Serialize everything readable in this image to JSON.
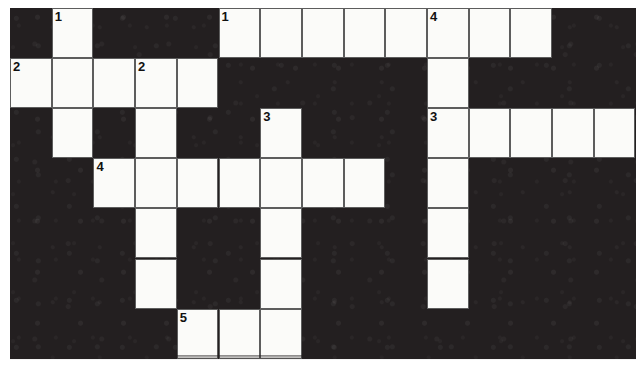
{
  "puzzle": {
    "title": "Crossword Grid",
    "grid": {
      "columns": 15,
      "rows": 7,
      "cell_width": 41.7,
      "cell_height": 50.1,
      "block_color": "#231f20",
      "cell_color": "#fbfbf9",
      "cell_border_color": "#5d5d5d",
      "number_color": "#111111"
    },
    "white_cells": [
      {
        "row": 1,
        "col": 2,
        "number": "1"
      },
      {
        "row": 1,
        "col": 6,
        "number": "1"
      },
      {
        "row": 1,
        "col": 7,
        "number": ""
      },
      {
        "row": 1,
        "col": 8,
        "number": ""
      },
      {
        "row": 1,
        "col": 9,
        "number": ""
      },
      {
        "row": 1,
        "col": 10,
        "number": ""
      },
      {
        "row": 1,
        "col": 11,
        "number": "4"
      },
      {
        "row": 1,
        "col": 12,
        "number": ""
      },
      {
        "row": 1,
        "col": 13,
        "number": ""
      },
      {
        "row": 2,
        "col": 1,
        "number": "2"
      },
      {
        "row": 2,
        "col": 2,
        "number": ""
      },
      {
        "row": 2,
        "col": 3,
        "number": ""
      },
      {
        "row": 2,
        "col": 4,
        "number": "2"
      },
      {
        "row": 2,
        "col": 5,
        "number": ""
      },
      {
        "row": 2,
        "col": 11,
        "number": ""
      },
      {
        "row": 3,
        "col": 2,
        "number": ""
      },
      {
        "row": 3,
        "col": 4,
        "number": ""
      },
      {
        "row": 3,
        "col": 7,
        "number": "3"
      },
      {
        "row": 3,
        "col": 11,
        "number": "3"
      },
      {
        "row": 3,
        "col": 12,
        "number": ""
      },
      {
        "row": 3,
        "col": 13,
        "number": ""
      },
      {
        "row": 3,
        "col": 14,
        "number": ""
      },
      {
        "row": 3,
        "col": 15,
        "number": ""
      },
      {
        "row": 4,
        "col": 3,
        "number": "4"
      },
      {
        "row": 4,
        "col": 4,
        "number": ""
      },
      {
        "row": 4,
        "col": 5,
        "number": ""
      },
      {
        "row": 4,
        "col": 6,
        "number": ""
      },
      {
        "row": 4,
        "col": 7,
        "number": ""
      },
      {
        "row": 4,
        "col": 8,
        "number": ""
      },
      {
        "row": 4,
        "col": 9,
        "number": ""
      },
      {
        "row": 4,
        "col": 11,
        "number": ""
      },
      {
        "row": 5,
        "col": 4,
        "number": ""
      },
      {
        "row": 5,
        "col": 7,
        "number": ""
      },
      {
        "row": 5,
        "col": 11,
        "number": ""
      },
      {
        "row": 6,
        "col": 4,
        "number": ""
      },
      {
        "row": 6,
        "col": 7,
        "number": ""
      },
      {
        "row": 6,
        "col": 11,
        "number": ""
      },
      {
        "row": 7,
        "col": 5,
        "number": "5"
      },
      {
        "row": 7,
        "col": 6,
        "number": ""
      },
      {
        "row": 7,
        "col": 7,
        "number": ""
      }
    ]
  }
}
